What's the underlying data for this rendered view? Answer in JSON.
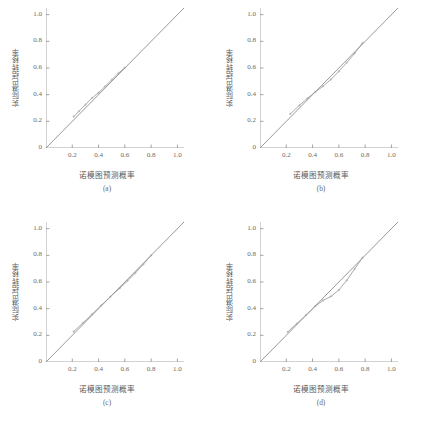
{
  "figure": {
    "background": "#ffffff",
    "line_color": "#8d8d8d",
    "curve_color": "#9a9a9a",
    "axis_color": "#9b9b9b",
    "text_color": "#5a5a5a"
  },
  "axis": {
    "xticks": [
      "0.2",
      "0.4",
      "0.6",
      "0.8",
      "1.0"
    ],
    "yticks": [
      "0.2",
      "0.4",
      "0.6",
      "0.8",
      "1.0"
    ],
    "origin_label": "0",
    "xlabel": "诺模图预测概率",
    "ylabel": "实际淋巴结转移率"
  },
  "chart_data": [
    {
      "type": "line",
      "panel": "a",
      "caption": "(a)",
      "title": "",
      "xlabel": "诺模图预测概率",
      "ylabel": "实际淋巴结转移率",
      "xlim": [
        0,
        1.05
      ],
      "ylim": [
        0,
        1.05
      ],
      "grid": false,
      "legend": "none",
      "series": [
        {
          "name": "理想参考线",
          "style": "diagonal-reference",
          "x": [
            0,
            1.05
          ],
          "values": [
            0,
            1.05
          ]
        },
        {
          "name": "校准曲线",
          "style": "calibration-curve",
          "x": [
            0.21,
            0.25,
            0.3,
            0.35,
            0.4,
            0.45,
            0.5,
            0.55,
            0.6
          ],
          "values": [
            0.235,
            0.275,
            0.325,
            0.375,
            0.415,
            0.462,
            0.512,
            0.56,
            0.603
          ]
        }
      ]
    },
    {
      "type": "line",
      "panel": "b",
      "caption": "(b)",
      "title": "",
      "xlabel": "诺模图预测概率",
      "ylabel": "实际淋巴结转移率",
      "xlim": [
        0,
        1.05
      ],
      "ylim": [
        0,
        1.05
      ],
      "grid": false,
      "legend": "none",
      "series": [
        {
          "name": "理想参考线",
          "style": "diagonal-reference",
          "x": [
            0,
            1.05
          ],
          "values": [
            0,
            1.05
          ]
        },
        {
          "name": "校准曲线",
          "style": "calibration-curve",
          "x": [
            0.23,
            0.3,
            0.36,
            0.42,
            0.48,
            0.54,
            0.6,
            0.66,
            0.72,
            0.78
          ],
          "values": [
            0.255,
            0.32,
            0.372,
            0.42,
            0.463,
            0.515,
            0.575,
            0.64,
            0.71,
            0.788
          ]
        }
      ]
    },
    {
      "type": "line",
      "panel": "c",
      "caption": "(c)",
      "title": "",
      "xlabel": "诺模图预测概率",
      "ylabel": "实际淋巴结转移率",
      "xlim": [
        0,
        1.05
      ],
      "ylim": [
        0,
        1.05
      ],
      "grid": false,
      "legend": "none",
      "series": [
        {
          "name": "理想参考线",
          "style": "diagonal-reference",
          "x": [
            0,
            1.05
          ],
          "values": [
            0,
            1.05
          ]
        },
        {
          "name": "校准曲线",
          "style": "calibration-curve",
          "x": [
            0.21,
            0.28,
            0.35,
            0.42,
            0.49,
            0.56,
            0.62,
            0.68,
            0.74,
            0.8
          ],
          "values": [
            0.228,
            0.292,
            0.358,
            0.425,
            0.49,
            0.552,
            0.608,
            0.668,
            0.732,
            0.8
          ]
        }
      ]
    },
    {
      "type": "line",
      "panel": "d",
      "caption": "(d)",
      "title": "",
      "xlabel": "诺模图预测概率",
      "ylabel": "实际淋巴结转移率",
      "xlim": [
        0,
        1.05
      ],
      "ylim": [
        0,
        1.05
      ],
      "grid": false,
      "legend": "none",
      "series": [
        {
          "name": "理想参考线",
          "style": "diagonal-reference",
          "x": [
            0,
            1.05
          ],
          "values": [
            0,
            1.05
          ]
        },
        {
          "name": "校准曲线",
          "style": "calibration-curve",
          "x": [
            0.21,
            0.28,
            0.35,
            0.42,
            0.48,
            0.54,
            0.6,
            0.66,
            0.72,
            0.78
          ],
          "values": [
            0.225,
            0.288,
            0.352,
            0.418,
            0.462,
            0.492,
            0.54,
            0.612,
            0.698,
            0.782
          ]
        }
      ]
    }
  ]
}
